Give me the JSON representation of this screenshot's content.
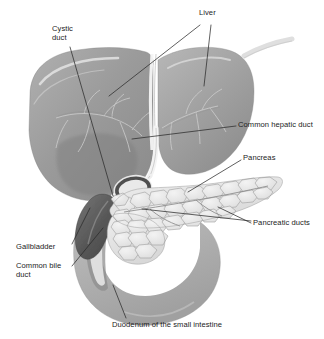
{
  "figure": {
    "width": 324,
    "height": 339,
    "style": "grayscale medical illustration",
    "background_color": "#ffffff",
    "leader_line_color": "#2b2b2b"
  },
  "labels": [
    {
      "id": "cystic-duct",
      "text": "Cystic\nduct",
      "x": 52,
      "y": 24,
      "align": "left"
    },
    {
      "id": "liver",
      "text": "Liver",
      "x": 199,
      "y": 8,
      "align": "left"
    },
    {
      "id": "common-hepatic-duct",
      "text": "Common hepatic duct",
      "x": 238,
      "y": 120,
      "align": "left"
    },
    {
      "id": "pancreas",
      "text": "Pancreas",
      "x": 243,
      "y": 153,
      "align": "left"
    },
    {
      "id": "pancreatic-ducts",
      "text": "Pancreatic ducts",
      "x": 253,
      "y": 218,
      "align": "left"
    },
    {
      "id": "gallbladder",
      "text": "Gallbladder",
      "x": 16,
      "y": 242,
      "align": "left"
    },
    {
      "id": "common-bile-duct",
      "text": "Common bile\nduct",
      "x": 16,
      "y": 261,
      "align": "left"
    },
    {
      "id": "duodenum",
      "text": "Duodenum of the small intestine",
      "x": 112,
      "y": 320,
      "align": "left"
    }
  ],
  "structures": [
    {
      "id": "liver-left-lobe",
      "name": "Liver left lobe",
      "fill": "#9d9d9d"
    },
    {
      "id": "liver-right-lobe",
      "name": "Liver right lobe",
      "fill": "#a3a3a3"
    },
    {
      "id": "gallbladder-body",
      "name": "Gallbladder",
      "fill": "#5e5e5e"
    },
    {
      "id": "pancreas-body",
      "name": "Pancreas",
      "fill": "#e2e2e2"
    },
    {
      "id": "duodenum-loop",
      "name": "Duodenum of the small intestine",
      "fill": "#b3b3b3"
    },
    {
      "id": "common-bile-duct-tube",
      "name": "Common bile duct",
      "fill": "#efefef"
    },
    {
      "id": "common-hepatic-duct-tube",
      "name": "Common hepatic duct",
      "fill": "#f2f2f2"
    },
    {
      "id": "cystic-duct-tube",
      "name": "Cystic duct",
      "fill": "#ededed"
    },
    {
      "id": "pancreatic-duct-line",
      "name": "Pancreatic ducts",
      "fill": "#8c8c8c"
    }
  ],
  "leaders": [
    {
      "id": "cystic-duct-leader",
      "from": [
        70,
        47
      ],
      "to": [
        113,
        196
      ]
    },
    {
      "id": "liver-leader-left",
      "from": [
        200,
        25
      ],
      "to": [
        109,
        96
      ]
    },
    {
      "id": "liver-leader-right",
      "from": [
        210,
        25
      ],
      "to": [
        205,
        85
      ]
    },
    {
      "id": "common-hepatic-duct-leader",
      "from": [
        236,
        126
      ],
      "to": [
        132,
        139
      ]
    },
    {
      "id": "pancreas-leader",
      "from": [
        241,
        160
      ],
      "to": [
        188,
        192
      ]
    },
    {
      "id": "pancreatic-ducts-leader-upper",
      "from": [
        251,
        221
      ],
      "to": [
        142,
        209
      ]
    },
    {
      "id": "pancreatic-ducts-leader-lower",
      "from": [
        251,
        223
      ],
      "to": [
        218,
        207
      ]
    },
    {
      "id": "gallbladder-leader",
      "from": [
        72,
        244
      ],
      "to": [
        90,
        208
      ]
    },
    {
      "id": "common-bile-duct-leader",
      "from": [
        72,
        266
      ],
      "to": [
        102,
        227
      ]
    },
    {
      "id": "duodenum-leader",
      "from": [
        126,
        318
      ],
      "to": [
        113,
        285
      ]
    }
  ]
}
